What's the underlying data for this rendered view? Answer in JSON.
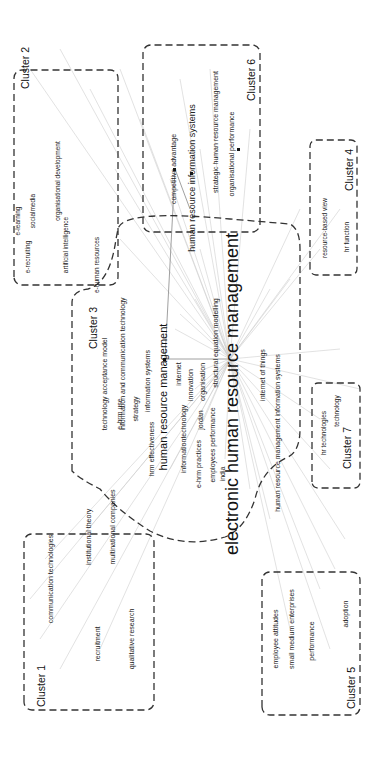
{
  "diagram": {
    "central_term": "electronic human resource management",
    "clusters": [
      {
        "id": 1,
        "label": "Cluster 1",
        "keywords": [
          "communication technologies",
          "institutional theory",
          "multinational companies",
          "recruitment",
          "qualitative research"
        ]
      },
      {
        "id": 2,
        "label": "Cluster 2",
        "keywords": [
          "social media",
          "e-learning",
          "e-recruiting",
          "organisational development",
          "artificial intelligence",
          "e-human resources"
        ]
      },
      {
        "id": 3,
        "label": "Cluster 3",
        "keywords": [
          "electronic human resource management",
          "technology acceptance model",
          "information and communication technology",
          "e-hrm use",
          "information systems",
          "strategy",
          "human resource management",
          "hrm effectiveness",
          "internet",
          "innovation",
          "information technology",
          "organisation",
          "jordan",
          "structural equation modelling",
          "e-hrm practices",
          "employees performance",
          "india",
          "internet of things",
          "human resource management information systems"
        ]
      },
      {
        "id": 4,
        "label": "Cluster 4",
        "keywords": [
          "resource-based view",
          "hr function"
        ]
      },
      {
        "id": 5,
        "label": "Cluster 5",
        "keywords": [
          "employee attitudes",
          "small medium enterprises",
          "performance",
          "adoption"
        ]
      },
      {
        "id": 6,
        "label": "Cluster 6",
        "keywords": [
          "competitive advantage",
          "human resource information systems",
          "strategic human resource management",
          "organisational performance"
        ]
      },
      {
        "id": 7,
        "label": "Cluster 7",
        "keywords": [
          "hr technologies",
          "technology"
        ]
      }
    ]
  },
  "labels": {
    "c1_title": "Cluster 1",
    "c1_k1": "communication technologies",
    "c1_k2": "institutional theory",
    "c1_k3": "multinational companies",
    "c1_k4": "recruitment",
    "c1_k5": "qualitative research",
    "c2_title": "Cluster 2",
    "c2_k1": "socialmedia",
    "c2_k2": "e-learning",
    "c2_k3": "e-recruiting",
    "c2_k4": "organisational development",
    "c2_k5": "artificial intelligence",
    "c2_k6": "e-human resources",
    "c3_title": "Cluster 3",
    "c3_central": "electronic human resource management",
    "c3_k1": "technology acceptance model",
    "c3_k2": "information and communication technology",
    "c3_k3": "e-hrm use",
    "c3_k4": "information systems",
    "c3_k5": "strategy",
    "c3_k6": "human resource management",
    "c3_k7": "hrm effectiveness",
    "c3_k8": "internet",
    "c3_k9": "innovation",
    "c3_k10": "informationtechnology",
    "c3_k11": "organisation",
    "c3_k12": "jordan",
    "c3_k13": "structural equation modelling",
    "c3_k14": "e-hrm practices",
    "c3_k15": "employees performance",
    "c3_k16": "india",
    "c3_k17": "internet of things",
    "c3_k18": "human resource management information systems",
    "c4_title": "Cluster 4",
    "c4_k1": "resource-based view",
    "c4_k2": "hr function",
    "c5_title": "Cluster 5",
    "c5_k1": "employee attitudes",
    "c5_k2": "small medium enterprises",
    "c5_k3": "performance",
    "c5_k4": "adoption",
    "c6_title": "Cluster 6",
    "c6_k1": "competitive advantage",
    "c6_k2": "human resource information systems",
    "c6_k3": "strategic human resource management",
    "c6_k4": "organisational performance",
    "c7_title": "Cluster 7",
    "c7_k1": "hr technologies",
    "c7_k2": "technology"
  },
  "colors": {
    "text": "#222222",
    "boundary": "#333333",
    "edge": "#c8c8c8",
    "edge_dark": "#888888",
    "background": "#ffffff"
  }
}
